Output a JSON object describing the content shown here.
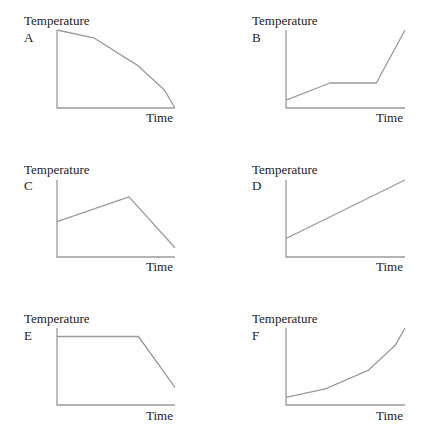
{
  "chart_data": [
    {
      "type": "line",
      "id": "A",
      "panel_label": "A",
      "ylabel": "Temperature",
      "xlabel": "Time",
      "xlim": [
        0,
        10
      ],
      "ylim": [
        0,
        10
      ],
      "points": [
        [
          0,
          10
        ],
        [
          3.1,
          9.0
        ],
        [
          6.8,
          5.5
        ],
        [
          9.1,
          2.3
        ],
        [
          10,
          0
        ]
      ],
      "description": "Temperature decreases at an increasing rate"
    },
    {
      "type": "line",
      "id": "B",
      "panel_label": "B",
      "ylabel": "Temperature",
      "xlabel": "Time",
      "xlim": [
        0,
        10
      ],
      "ylim": [
        0,
        10
      ],
      "points": [
        [
          0,
          1.0
        ],
        [
          3.7,
          3.2
        ],
        [
          7.6,
          3.2
        ],
        [
          10,
          10
        ]
      ],
      "description": "Temperature rises, plateaus, then rises steeply"
    },
    {
      "type": "line",
      "id": "C",
      "panel_label": "C",
      "ylabel": "Temperature",
      "xlabel": "Time",
      "xlim": [
        0,
        10
      ],
      "ylim": [
        0,
        10
      ],
      "points": [
        [
          0,
          4.6
        ],
        [
          6.1,
          7.8
        ],
        [
          10,
          1.2
        ]
      ],
      "description": "Temperature rises then falls"
    },
    {
      "type": "line",
      "id": "D",
      "panel_label": "D",
      "ylabel": "Temperature",
      "xlabel": "Time",
      "xlim": [
        0,
        10
      ],
      "ylim": [
        0,
        10
      ],
      "points": [
        [
          0,
          2.4
        ],
        [
          10,
          10
        ]
      ],
      "description": "Temperature rises linearly"
    },
    {
      "type": "line",
      "id": "E",
      "panel_label": "E",
      "ylabel": "Temperature",
      "xlabel": "Time",
      "xlim": [
        0,
        10
      ],
      "ylim": [
        0,
        10
      ],
      "points": [
        [
          0,
          8.9
        ],
        [
          6.9,
          8.9
        ],
        [
          10,
          2.3
        ]
      ],
      "description": "Temperature constant then falls"
    },
    {
      "type": "line",
      "id": "F",
      "panel_label": "F",
      "ylabel": "Temperature",
      "xlabel": "Time",
      "xlim": [
        0,
        10
      ],
      "ylim": [
        0,
        10
      ],
      "points": [
        [
          0,
          1.0
        ],
        [
          3.3,
          2.1
        ],
        [
          6.9,
          4.5
        ],
        [
          9.2,
          7.8
        ],
        [
          10,
          10
        ]
      ],
      "description": "Temperature increases at an increasing rate"
    }
  ],
  "colors": {
    "line": "#9a9a9a",
    "text": "#222222"
  }
}
